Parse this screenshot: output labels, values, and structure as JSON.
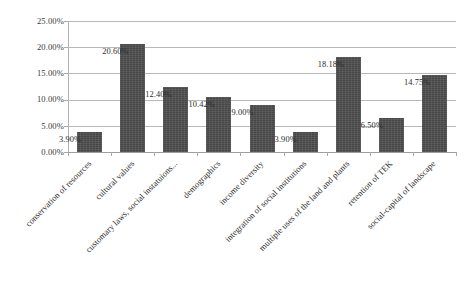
{
  "chart_data": {
    "type": "bar",
    "title": "",
    "subtitle": "",
    "xlabel": "",
    "ylabel": "",
    "ylim": [
      0,
      25
    ],
    "yticks": [
      0,
      5,
      10,
      15,
      20,
      25
    ],
    "ytick_labels": [
      "0.00%",
      "5.00%",
      "10.00%",
      "15.00%",
      "20.00%",
      "25.00%"
    ],
    "grid": true,
    "legend": "none",
    "value_suffix": "%",
    "bar_color": "#4e4e4e",
    "gridline_color": "#b8b8b8",
    "axis_color": "#9e9e9e",
    "categories": [
      "conservation of resources",
      "cultural values",
      "customary laws, social instatuions...",
      "demographics",
      "income diversity",
      "integration of social institutions",
      "multiple uses of the land and plants",
      "retention of TEK",
      "social-capital of landscape"
    ],
    "values": [
      3.9,
      20.6,
      12.4,
      10.42,
      9.0,
      3.9,
      18.18,
      6.5,
      14.75
    ],
    "data_labels": [
      "3.90%",
      "20.60%",
      "12.40%",
      "10.42%",
      "9.00%",
      "3.90%",
      "18.18%",
      "6.50%",
      "14.75%"
    ]
  }
}
